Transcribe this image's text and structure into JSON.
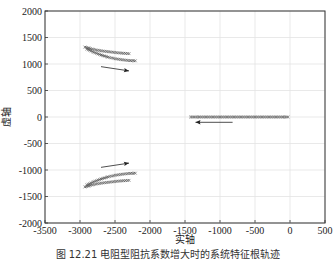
{
  "chart_data": {
    "type": "scatter",
    "title": "",
    "xlabel": "实轴",
    "ylabel": "虚轴",
    "xlim": [
      -3500,
      500
    ],
    "ylim": [
      -2000,
      2000
    ],
    "xticks": [
      -3500,
      -3000,
      -2500,
      -2000,
      -1500,
      -1000,
      -500,
      0,
      500
    ],
    "yticks": [
      -2000,
      -1500,
      -1000,
      -500,
      0,
      500,
      1000,
      1500,
      2000
    ],
    "grid": true,
    "marker": "x",
    "series": [
      {
        "name": "upper-band-1",
        "x": [
          -2930,
          -2850,
          -2750,
          -2650,
          -2550,
          -2450,
          -2350,
          -2300
        ],
        "y": [
          1320,
          1290,
          1260,
          1240,
          1225,
          1210,
          1200,
          1195
        ]
      },
      {
        "name": "upper-band-2",
        "x": [
          -2900,
          -2800,
          -2700,
          -2600,
          -2500,
          -2400,
          -2300,
          -2210
        ],
        "y": [
          1280,
          1220,
          1170,
          1130,
          1100,
          1080,
          1065,
          1060
        ]
      },
      {
        "name": "lower-band-1",
        "x": [
          -2930,
          -2850,
          -2750,
          -2650,
          -2550,
          -2450,
          -2350,
          -2300
        ],
        "y": [
          -1320,
          -1290,
          -1260,
          -1240,
          -1225,
          -1210,
          -1200,
          -1195
        ]
      },
      {
        "name": "lower-band-2",
        "x": [
          -2900,
          -2800,
          -2700,
          -2600,
          -2500,
          -2400,
          -2300,
          -2210
        ],
        "y": [
          -1280,
          -1220,
          -1170,
          -1130,
          -1100,
          -1080,
          -1065,
          -1060
        ]
      },
      {
        "name": "real-axis",
        "x": [
          -1420,
          -1300,
          -1200,
          -1100,
          -1000,
          -900,
          -800,
          -700,
          -600,
          -500,
          -400,
          -300,
          -200,
          -100,
          -30
        ],
        "y": [
          0,
          0,
          0,
          0,
          0,
          0,
          0,
          0,
          0,
          0,
          0,
          0,
          0,
          0,
          0
        ]
      }
    ],
    "annotations": [
      {
        "type": "arrow",
        "from": [
          -2700,
          950
        ],
        "to": [
          -2300,
          870
        ],
        "direction": "right"
      },
      {
        "type": "arrow",
        "from": [
          -2700,
          -950
        ],
        "to": [
          -2300,
          -870
        ],
        "direction": "right"
      },
      {
        "type": "arrow",
        "from": [
          -820,
          -100
        ],
        "to": [
          -1350,
          -100
        ],
        "direction": "left"
      }
    ]
  },
  "caption": "图 12.21 电阻型阻抗系数增大时的系统特征根轨迹"
}
